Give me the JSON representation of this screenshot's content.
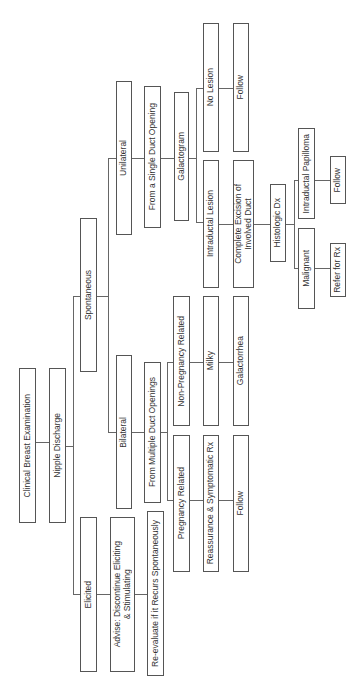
{
  "diagram": {
    "orientation": "rotated-90-ccw",
    "nodes": {
      "clinical_breast_exam": "Clinical Breast Examination",
      "nipple_discharge": "Nipple Discharge",
      "elicited": "Elicited",
      "advise": "Advise: Discontinue Eliciting\n& Stimulating",
      "reevaluate": "Re-evaluate if it Recurs Spontaneously",
      "spontaneous": "Spontaneous",
      "bilateral": "Bilateral",
      "multiple_duct": "From Multiple Duct Openings",
      "pregnancy_related": "Pregnancy Related",
      "reassurance": "Reassurance & Symptomatic Rx",
      "follow_pregnancy": "Follow",
      "non_pregnancy_related": "Non-Pregnancy Related",
      "milky": "Milky",
      "galactorrhea": "Galactorrhea",
      "unilateral": "Unilateral",
      "single_duct": "From a Single Duct Opening",
      "galactogram": "Galactogram",
      "no_lesion": "No Lesion",
      "follow_no_lesion": "Follow",
      "intraductal_lesion": "Intraductal Lesion",
      "complete_excision": "Complete Excision of\nInvolved Duct",
      "histologic_dx": "Histologic Dx",
      "intraductal_papilloma": "Intraductal Papilloma",
      "follow_papilloma": "Follow",
      "malignant": "Malignant",
      "refer_for_rx": "Refer for Rx"
    },
    "edges": [
      [
        "clinical_breast_exam",
        "nipple_discharge"
      ],
      [
        "nipple_discharge",
        "elicited"
      ],
      [
        "nipple_discharge",
        "spontaneous"
      ],
      [
        "elicited",
        "advise"
      ],
      [
        "advise",
        "reevaluate"
      ],
      [
        "spontaneous",
        "bilateral"
      ],
      [
        "spontaneous",
        "unilateral"
      ],
      [
        "bilateral",
        "multiple_duct"
      ],
      [
        "multiple_duct",
        "pregnancy_related"
      ],
      [
        "multiple_duct",
        "non_pregnancy_related"
      ],
      [
        "pregnancy_related",
        "reassurance"
      ],
      [
        "reassurance",
        "follow_pregnancy"
      ],
      [
        "non_pregnancy_related",
        "milky"
      ],
      [
        "milky",
        "galactorrhea"
      ],
      [
        "unilateral",
        "single_duct"
      ],
      [
        "single_duct",
        "galactogram"
      ],
      [
        "galactogram",
        "no_lesion"
      ],
      [
        "galactogram",
        "intraductal_lesion"
      ],
      [
        "no_lesion",
        "follow_no_lesion"
      ],
      [
        "intraductal_lesion",
        "complete_excision"
      ],
      [
        "complete_excision",
        "histologic_dx"
      ],
      [
        "histologic_dx",
        "intraductal_papilloma"
      ],
      [
        "histologic_dx",
        "malignant"
      ],
      [
        "intraductal_papilloma",
        "follow_papilloma"
      ],
      [
        "malignant",
        "refer_for_rx"
      ]
    ]
  }
}
